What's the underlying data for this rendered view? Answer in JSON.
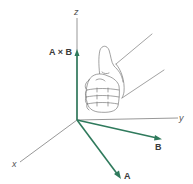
{
  "colors": {
    "vector": "#2f7a5c",
    "axis": "#6b6b6b",
    "hand": "#7a7a7a",
    "background": "#ffffff"
  },
  "axes": {
    "x": {
      "label": "x"
    },
    "y": {
      "label": "y"
    },
    "z": {
      "label": "z"
    }
  },
  "vectors": {
    "a": {
      "label": "A"
    },
    "b": {
      "label": "B"
    },
    "cross": {
      "label": "A × B"
    }
  },
  "illustration": {
    "subject": "right hand, thumb up, fingers curled"
  }
}
